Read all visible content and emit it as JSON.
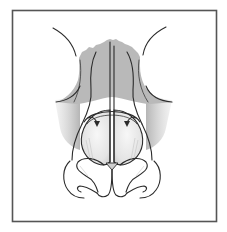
{
  "figure": {
    "type": "anatomical-illustration",
    "view": "frontal-basal",
    "caption": "",
    "labels": [],
    "colors": {
      "background": "#ffffff",
      "frame": "#555555",
      "ink": "#2b2b2b",
      "bone_shading": "#b9b9b9",
      "lateral_shading": "#d2d2d2",
      "dome_highlight": "#f4f4f4"
    },
    "components": [
      {
        "id": "nasal-bones",
        "description": "gray shaded upper nasal vault with irregular top edge"
      },
      {
        "id": "septum",
        "description": "central vertical double line"
      },
      {
        "id": "upper-lateral-cartilages",
        "description": "paired curved lines flanking the septum"
      },
      {
        "id": "inward-arrows",
        "description": "two curved arrows pointing medially toward the domes",
        "count": 2
      },
      {
        "id": "lower-lateral-domes",
        "description": "paired rounded cartilage domes"
      },
      {
        "id": "alar-outlines",
        "description": "paired nostril / ala curves at the base"
      },
      {
        "id": "brow-arcs",
        "description": "paired arcs at top-left and top-right"
      }
    ]
  }
}
